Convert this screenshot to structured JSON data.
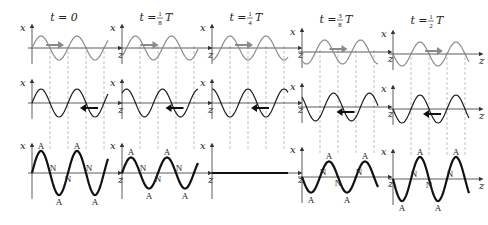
{
  "figure": {
    "axis_labels": {
      "vertical": "x",
      "horizontal": "z"
    },
    "node_label": "N",
    "antinode_label": "A",
    "colors": {
      "forward_wave": "#8a8a8a",
      "backward_wave": "#1a1a1a",
      "standing_wave": "#111111",
      "axis": "#333333",
      "guide": "#999999",
      "forward_arrow": "#8a8a8a",
      "backward_arrow": "#111111"
    },
    "panels": [
      {
        "time_prefix": "t =",
        "time_value": "0",
        "fraction": null,
        "phase_fraction_of_period": 0
      },
      {
        "time_prefix": "t =",
        "time_value": "T",
        "fraction": {
          "num": "1",
          "den": "8"
        },
        "phase_fraction_of_period": 0.125
      },
      {
        "time_prefix": "t =",
        "time_value": "T",
        "fraction": {
          "num": "1",
          "den": "4"
        },
        "phase_fraction_of_period": 0.25
      },
      {
        "time_prefix": "t =",
        "time_value": "T",
        "fraction": {
          "num": "3",
          "den": "8"
        },
        "phase_fraction_of_period": 0.375
      },
      {
        "time_prefix": "t =",
        "time_value": "T",
        "fraction": {
          "num": "1",
          "den": "2"
        },
        "phase_fraction_of_period": 0.5
      }
    ],
    "rows": [
      {
        "name": "forward-wave",
        "direction": "+z"
      },
      {
        "name": "backward-wave",
        "direction": "-z"
      },
      {
        "name": "standing-wave",
        "direction": "none"
      }
    ]
  }
}
